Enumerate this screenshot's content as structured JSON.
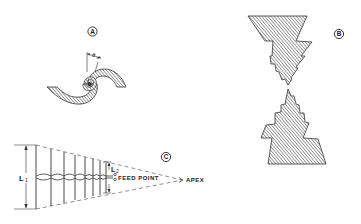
{
  "figure": {
    "panels": [
      {
        "id": "A",
        "label": "A",
        "description": "Two-arm equiangular spiral antenna (hatched arms)",
        "dimension_label": "θ",
        "dimension_subscript": "o"
      },
      {
        "id": "B",
        "label": "B",
        "description": "Log-periodic toothed bow-tie antenna (hatched)"
      },
      {
        "id": "C",
        "label": "C",
        "description": "Log-periodic dipole array",
        "dimension_L1": "L",
        "dimension_L1_sub": "1",
        "dimension_L2": "L",
        "dimension_L2_sub": "2",
        "feed_point_label": "FEED POINT",
        "apex_label": "APEX"
      }
    ]
  }
}
